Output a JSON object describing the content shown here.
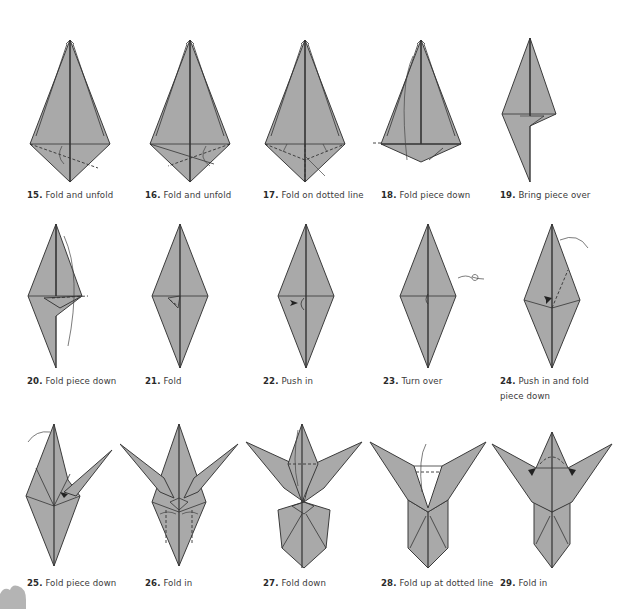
{
  "diagram": {
    "paper_color": "#a9a9a9",
    "line_color": "#333333",
    "background": "#ffffff",
    "steps": [
      {
        "number": "15.",
        "instruction": "Fold and unfold"
      },
      {
        "number": "16.",
        "instruction": "Fold and unfold"
      },
      {
        "number": "17.",
        "instruction": "Fold on dotted line"
      },
      {
        "number": "18.",
        "instruction": "Fold piece down"
      },
      {
        "number": "19.",
        "instruction": "Bring piece over"
      },
      {
        "number": "20.",
        "instruction": "Fold piece down"
      },
      {
        "number": "21.",
        "instruction": "Fold"
      },
      {
        "number": "22.",
        "instruction": "Push in"
      },
      {
        "number": "23.",
        "instruction": "Turn over"
      },
      {
        "number": "24.",
        "instruction": "Push in and fold piece down"
      },
      {
        "number": "25.",
        "instruction": "Fold piece down"
      },
      {
        "number": "26.",
        "instruction": "Fold in"
      },
      {
        "number": "27.",
        "instruction": "Fold down"
      },
      {
        "number": "28.",
        "instruction": "Fold up at dotted line"
      },
      {
        "number": "29.",
        "instruction": "Fold in"
      }
    ]
  }
}
